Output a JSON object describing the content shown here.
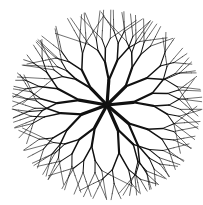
{
  "image": {
    "subject": "tree-plan-symbol",
    "style": "black ink line drawing of radial branching tree canopy on white",
    "center": [
      107,
      105
    ],
    "radius": 95,
    "ink_color": "#111111",
    "background_color": "#ffffff",
    "main_branches": 9
  }
}
